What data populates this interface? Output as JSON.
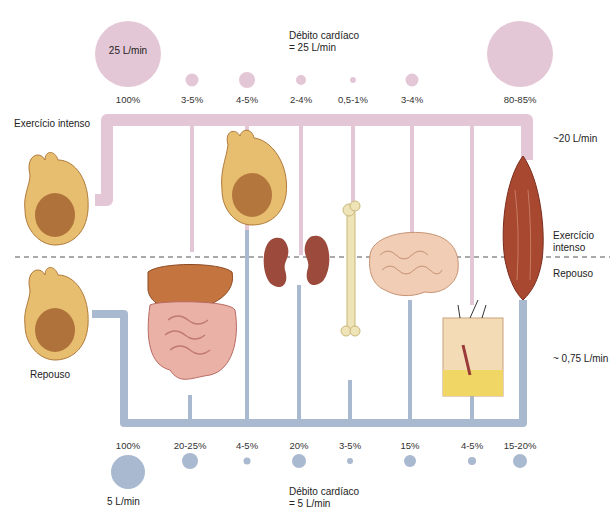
{
  "title_exercise": {
    "line1": "Débito cardíaco",
    "line2": "= 25 L/min"
  },
  "title_rest": {
    "line1": "Débito cardíaco",
    "line2": "= 5 L/min"
  },
  "left_labels": {
    "exercise": "Exercício intenso",
    "rest": "Repouso"
  },
  "right_labels": {
    "exercise_flow": "~20 L/min",
    "exercise": {
      "line1": "Exercício",
      "line2": "intenso"
    },
    "rest": "Repouso",
    "rest_flow": "~ 0,75 L/min"
  },
  "exercise_total": {
    "value": "25 L/min",
    "percent": "100%"
  },
  "rest_total": {
    "value": "5 L/min",
    "percent": "100%"
  },
  "organs": [
    "Fígado e trato digestório",
    "Coração (coronárias)",
    "Rins",
    "Osso",
    "Encéfalo",
    "Pele",
    "Músculo esquelético"
  ],
  "colors": {
    "exercise": "#e4c7d6",
    "rest": "#a9b9cf",
    "divider": "#555555"
  },
  "chart_data": {
    "type": "diagram",
    "series": [
      {
        "name": "Exercício intenso",
        "total": "25 L/min",
        "values": [
          "3-5%",
          "4-5%",
          "2-4%",
          "0,5-1%",
          "3-4%",
          "80-85%"
        ],
        "organs": [
          "Fígado e trato digestório",
          "Coração",
          "Rins",
          "Osso",
          "Encéfalo",
          "Músculo esquelético"
        ],
        "muscle_flow": "~20 L/min"
      },
      {
        "name": "Repouso",
        "total": "5 L/min",
        "values": [
          "20-25%",
          "4-5%",
          "20%",
          "3-5%",
          "15%",
          "4-5%",
          "15-20%"
        ],
        "organs": [
          "Fígado e trato digestório",
          "Coração",
          "Rins",
          "Osso",
          "Encéfalo",
          "Pele",
          "Músculo esquelético"
        ],
        "muscle_flow": "~ 0,75 L/min"
      }
    ]
  },
  "exercise_pcts": [
    {
      "label": "3-5%",
      "x": 192,
      "d": 13
    },
    {
      "label": "4-5%",
      "x": 247,
      "d": 16
    },
    {
      "label": "2-4%",
      "x": 301,
      "d": 10
    },
    {
      "label": "0,5-1%",
      "x": 353,
      "d": 6
    },
    {
      "label": "3-4%",
      "x": 412,
      "d": 13
    },
    {
      "label": "80-85%",
      "x": 520,
      "d": 66
    }
  ],
  "rest_pcts": [
    {
      "label": "20-25%",
      "x": 190,
      "d": 16
    },
    {
      "label": "4-5%",
      "x": 247,
      "d": 7
    },
    {
      "label": "20%",
      "x": 299,
      "d": 14
    },
    {
      "label": "3-5%",
      "x": 350,
      "d": 6
    },
    {
      "label": "15%",
      "x": 410,
      "d": 12
    },
    {
      "label": "4-5%",
      "x": 472,
      "d": 8
    },
    {
      "label": "15-20%",
      "x": 520,
      "d": 14
    }
  ]
}
